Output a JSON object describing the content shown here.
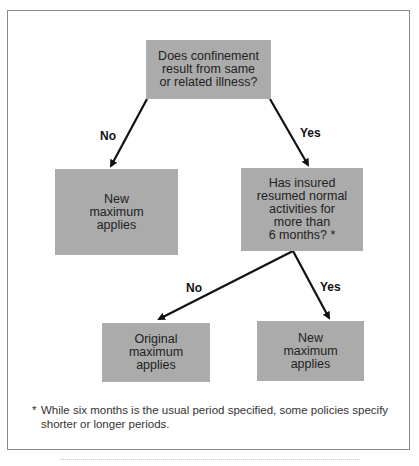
{
  "diagram": {
    "type": "decision-flowchart",
    "nodes": {
      "q1": {
        "text": "Does confinement\nresult from same\nor related illness?"
      },
      "r1_no": {
        "text": "New\nmaximum\napplies"
      },
      "q2": {
        "text": "Has insured\nresumed normal\nactivities for\nmore than\n6 months? *"
      },
      "r2_no": {
        "text": "Original\nmaximum\napplies"
      },
      "r2_yes": {
        "text": "New\nmaximum\napplies"
      }
    },
    "edges": [
      {
        "from": "q1",
        "to": "r1_no",
        "label": "No"
      },
      {
        "from": "q1",
        "to": "q2",
        "label": "Yes"
      },
      {
        "from": "q2",
        "to": "r2_no",
        "label": "No"
      },
      {
        "from": "q2",
        "to": "r2_yes",
        "label": "Yes"
      }
    ],
    "footnote": {
      "marker": "*",
      "text": "While six months is the usual period specified, some policies specify shorter or longer periods."
    },
    "colors": {
      "box_fill": "#ababab",
      "arrow": "#111111",
      "frame": "#8a8a8a"
    }
  }
}
